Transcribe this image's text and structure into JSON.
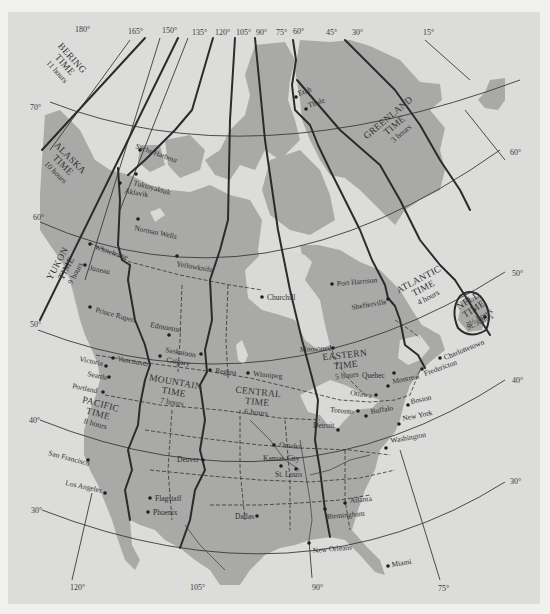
{
  "map": {
    "title": "North American Time Zones",
    "longitudes_top": [
      {
        "label": "180°",
        "x": 75,
        "y": 32
      },
      {
        "label": "165°",
        "x": 128,
        "y": 34
      },
      {
        "label": "150°",
        "x": 162,
        "y": 33
      },
      {
        "label": "135°",
        "x": 192,
        "y": 35
      },
      {
        "label": "120°",
        "x": 215,
        "y": 35
      },
      {
        "label": "105°",
        "x": 236,
        "y": 35
      },
      {
        "label": "90°",
        "x": 256,
        "y": 35
      },
      {
        "label": "75°",
        "x": 276,
        "y": 35
      },
      {
        "label": "60°",
        "x": 293,
        "y": 34
      },
      {
        "label": "45°",
        "x": 326,
        "y": 35
      },
      {
        "label": "30°",
        "x": 352,
        "y": 35
      },
      {
        "label": "15°",
        "x": 423,
        "y": 35
      }
    ],
    "longitudes_bottom": [
      {
        "label": "120°",
        "x": 70,
        "y": 590
      },
      {
        "label": "105°",
        "x": 190,
        "y": 590
      },
      {
        "label": "90°",
        "x": 312,
        "y": 590
      },
      {
        "label": "75°",
        "x": 438,
        "y": 591
      }
    ],
    "latitudes": [
      {
        "label": "70°",
        "x": 30,
        "y": 110
      },
      {
        "label": "60°",
        "x": 33,
        "y": 220
      },
      {
        "label": "50°",
        "x": 30,
        "y": 327
      },
      {
        "label": "40°",
        "x": 29,
        "y": 423
      },
      {
        "label": "30°",
        "x": 31,
        "y": 513
      },
      {
        "label": "60°",
        "x": 510,
        "y": 155
      },
      {
        "label": "50°",
        "x": 512,
        "y": 276
      },
      {
        "label": "40°",
        "x": 512,
        "y": 383
      },
      {
        "label": "30°",
        "x": 510,
        "y": 484
      }
    ],
    "time_zones": [
      {
        "name": "BERING TIME",
        "offset": "11 hours",
        "x": 70,
        "y": 60,
        "rot": 48
      },
      {
        "name": "ALASKA TIME",
        "offset": "10 hours",
        "x": 68,
        "y": 160,
        "rot": 45
      },
      {
        "name": "YUKON TIME",
        "offset": "9 hours",
        "x": 60,
        "y": 265,
        "rot": -62
      },
      {
        "name": "PACIFIC TIME",
        "offset": "8 hours",
        "x": 100,
        "y": 407,
        "rot": 15
      },
      {
        "name": "MOUNTAIN TIME",
        "offset": "7 hours",
        "x": 175,
        "y": 385,
        "rot": 10
      },
      {
        "name": "CENTRAL TIME",
        "offset": "6 hours",
        "x": 258,
        "y": 395,
        "rot": 6
      },
      {
        "name": "EASTERN TIME",
        "offset": "5 hours",
        "x": 345,
        "y": 358,
        "rot": -6
      },
      {
        "name": "ATLANTIC TIME",
        "offset": "4 hours",
        "x": 420,
        "y": 282,
        "rot": -28
      },
      {
        "name": "NFLD TIME",
        "offset": "3½ hours",
        "x": 470,
        "y": 303,
        "rot": -32
      },
      {
        "name": "GREENLAND TIME",
        "offset": "3 hours",
        "x": 390,
        "y": 120,
        "rot": -40
      }
    ],
    "cities": [
      {
        "name": "Sachs Harbour",
        "dx": 140,
        "dy": 150,
        "lx": 135,
        "ly": 148,
        "rot": 20
      },
      {
        "name": "Tuktoyaktuk",
        "dx": 136,
        "dy": 174,
        "lx": 133,
        "ly": 185,
        "rot": 15
      },
      {
        "name": "Aklavik",
        "dx": 120,
        "dy": 183,
        "lx": 124,
        "ly": 193,
        "rot": 10
      },
      {
        "name": "Norman Wells",
        "dx": 138,
        "dy": 219,
        "lx": 134,
        "ly": 230,
        "rot": 12
      },
      {
        "name": "Yellowknife",
        "dx": 177,
        "dy": 256,
        "lx": 176,
        "ly": 266,
        "rot": 10
      },
      {
        "name": "Whitehorse",
        "dx": 90,
        "dy": 244,
        "lx": 94,
        "ly": 249,
        "rot": 18
      },
      {
        "name": "Juneau",
        "dx": 85,
        "dy": 265,
        "lx": 89,
        "ly": 270,
        "rot": 12
      },
      {
        "name": "Prince Rupert",
        "dx": 90,
        "dy": 307,
        "lx": 95,
        "ly": 312,
        "rot": 15
      },
      {
        "name": "Edmonton",
        "dx": 169,
        "dy": 335,
        "lx": 150,
        "ly": 327,
        "rot": 10
      },
      {
        "name": "Saskatoon",
        "dx": 201,
        "dy": 354,
        "lx": 165,
        "ly": 352,
        "rot": 10
      },
      {
        "name": "Calgary",
        "dx": 160,
        "dy": 356,
        "lx": 166,
        "ly": 362,
        "rot": 10
      },
      {
        "name": "Regina",
        "dx": 210,
        "dy": 370,
        "lx": 215,
        "ly": 373,
        "rot": 5
      },
      {
        "name": "Winnipeg",
        "dx": 248,
        "dy": 373,
        "lx": 253,
        "ly": 376,
        "rot": 5
      },
      {
        "name": "Churchill",
        "dx": 262,
        "dy": 297,
        "lx": 267,
        "ly": 300,
        "rot": 0
      },
      {
        "name": "Port Harrison",
        "dx": 332,
        "dy": 284,
        "lx": 337,
        "ly": 286,
        "rot": -5
      },
      {
        "name": "Shefferville",
        "dx": 388,
        "dy": 299,
        "lx": 352,
        "ly": 310,
        "rot": -10
      },
      {
        "name": "Moosonee",
        "dx": 333,
        "dy": 348,
        "lx": 300,
        "ly": 352,
        "rot": -3
      },
      {
        "name": "Charlottetown",
        "dx": 440,
        "dy": 358,
        "lx": 445,
        "ly": 360,
        "rot": -22
      },
      {
        "name": "Fredericton",
        "dx": 422,
        "dy": 369,
        "lx": 425,
        "ly": 376,
        "rot": -20
      },
      {
        "name": "Quebec",
        "dx": 394,
        "dy": 373,
        "lx": 362,
        "ly": 378,
        "rot": 0
      },
      {
        "name": "Montreal",
        "dx": 388,
        "dy": 386,
        "lx": 393,
        "ly": 384,
        "rot": -12
      },
      {
        "name": "Ottawa",
        "dx": 376,
        "dy": 395,
        "lx": 350,
        "ly": 395,
        "rot": 8
      },
      {
        "name": "Toronto",
        "dx": 358,
        "dy": 411,
        "lx": 330,
        "ly": 412,
        "rot": 5
      },
      {
        "name": "Buffalo",
        "dx": 366,
        "dy": 416,
        "lx": 371,
        "ly": 414,
        "rot": -10
      },
      {
        "name": "Boston",
        "dx": 408,
        "dy": 405,
        "lx": 411,
        "ly": 404,
        "rot": -12
      },
      {
        "name": "New York",
        "dx": 399,
        "dy": 424,
        "lx": 403,
        "ly": 421,
        "rot": -12
      },
      {
        "name": "Detroit",
        "dx": 338,
        "dy": 430,
        "lx": 313,
        "ly": 428,
        "rot": 0
      },
      {
        "name": "Washington",
        "dx": 386,
        "dy": 448,
        "lx": 391,
        "ly": 443,
        "rot": -10
      },
      {
        "name": "Omaha",
        "dx": 274,
        "dy": 445,
        "lx": 279,
        "ly": 447,
        "rot": 5
      },
      {
        "name": "Kansas City",
        "dx": 281,
        "dy": 466,
        "lx": 263,
        "ly": 461,
        "rot": 0
      },
      {
        "name": "St. Louis",
        "dx": 296,
        "dy": 469,
        "lx": 275,
        "ly": 477,
        "rot": 0
      },
      {
        "name": "Denver",
        "dx": 203,
        "dy": 460,
        "lx": 177,
        "ly": 462,
        "rot": 0
      },
      {
        "name": "Flagstaff",
        "dx": 150,
        "dy": 498,
        "lx": 155,
        "ly": 501,
        "rot": 0
      },
      {
        "name": "Phoenix",
        "dx": 148,
        "dy": 512,
        "lx": 153,
        "ly": 515,
        "rot": 0
      },
      {
        "name": "Dallas",
        "dx": 257,
        "dy": 516,
        "lx": 235,
        "ly": 519,
        "rot": 0
      },
      {
        "name": "Atlanta",
        "dx": 345,
        "dy": 503,
        "lx": 350,
        "ly": 503,
        "rot": -5
      },
      {
        "name": "Birmingham",
        "dx": 325,
        "dy": 509,
        "lx": 327,
        "ly": 519,
        "rot": -5
      },
      {
        "name": "New Orleans",
        "dx": 309,
        "dy": 543,
        "lx": 313,
        "ly": 553,
        "rot": -5
      },
      {
        "name": "Miami",
        "dx": 388,
        "dy": 566,
        "lx": 392,
        "ly": 567,
        "rot": -10
      },
      {
        "name": "Los Angeles",
        "dx": 105,
        "dy": 493,
        "lx": 65,
        "ly": 485,
        "rot": 12
      },
      {
        "name": "San Francisco",
        "dx": 88,
        "dy": 460,
        "lx": 48,
        "ly": 455,
        "rot": 15
      },
      {
        "name": "Portland",
        "dx": 103,
        "dy": 392,
        "lx": 72,
        "ly": 388,
        "rot": 12
      },
      {
        "name": "Seattle",
        "dx": 109,
        "dy": 377,
        "lx": 87,
        "ly": 376,
        "rot": 12
      },
      {
        "name": "Victoria",
        "dx": 106,
        "dy": 366,
        "lx": 79,
        "ly": 361,
        "rot": 12
      },
      {
        "name": "Vancouver",
        "dx": 113,
        "dy": 358,
        "lx": 117,
        "ly": 361,
        "rot": 10
      },
      {
        "name": "Etah",
        "dx": 296,
        "dy": 97,
        "lx": 299,
        "ly": 96,
        "rot": -20
      },
      {
        "name": "Thule",
        "dx": 306,
        "dy": 109,
        "lx": 309,
        "ly": 108,
        "rot": -20
      },
      {
        "name": "St. John's",
        "dx": 485,
        "dy": 317,
        "lx": 468,
        "ly": 330,
        "rot": -25
      }
    ]
  }
}
